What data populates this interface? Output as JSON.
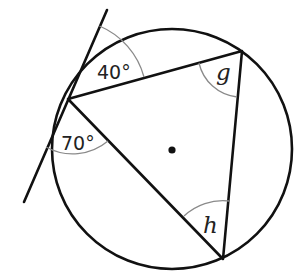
{
  "diagram": {
    "type": "circle-geometry",
    "circle": {
      "cx": 172,
      "cy": 149,
      "r": 120,
      "center_dot": true
    },
    "vertices": {
      "A": {
        "x": 68,
        "y": 99
      },
      "B": {
        "x": 242,
        "y": 51
      },
      "C": {
        "x": 223,
        "y": 259
      }
    },
    "tangent_line": {
      "x1": 107,
      "y1": 10,
      "x2": 24,
      "y2": 202
    },
    "labels": {
      "angle_tangent_upper": "40°",
      "angle_tangent_lower": "70°",
      "angle_B": "g",
      "angle_C": "h"
    },
    "colors": {
      "line": "#111111",
      "arc": "#8a8a8a",
      "text": "#222222"
    }
  }
}
